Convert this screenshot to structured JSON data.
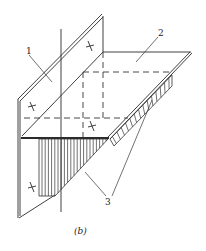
{
  "diagram": {
    "labels": {
      "vertical_plate": "1",
      "horizontal_plate": "2",
      "weld_seams": "3"
    },
    "caption": "(b)",
    "mark_symbol": "x"
  }
}
